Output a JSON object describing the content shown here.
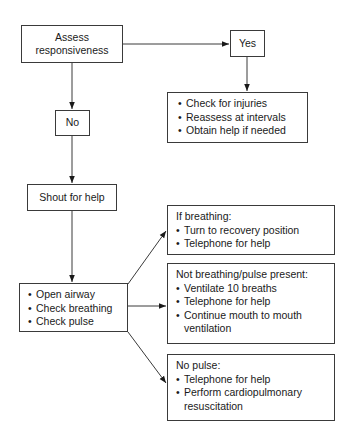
{
  "diagram": {
    "type": "flowchart",
    "nodes": {
      "assess": {
        "line1": "Assess",
        "line2": "responsiveness"
      },
      "yes": {
        "label": "Yes"
      },
      "no": {
        "label": "No"
      },
      "yes_actions": {
        "items": [
          "Check for injuries",
          "Reassess at intervals",
          "Obtain help if needed"
        ]
      },
      "shout": {
        "label": "Shout for help"
      },
      "abc": {
        "items": [
          "Open airway",
          "Check breathing",
          "Check pulse"
        ]
      },
      "breathing": {
        "heading": "If breathing:",
        "items": [
          "Turn to recovery position",
          "Telephone for help"
        ]
      },
      "not_breathing": {
        "heading": "Not breathing/pulse present:",
        "items": [
          "Ventilate 10 breaths",
          "Telephone for help",
          "Continue mouth to mouth ventilation"
        ]
      },
      "no_pulse": {
        "heading": "No pulse:",
        "items": [
          "Telephone for help",
          "Perform cardiopulmonary resuscitation"
        ]
      }
    },
    "edges": [
      {
        "from": "assess",
        "to": "yes"
      },
      {
        "from": "assess",
        "to": "no"
      },
      {
        "from": "yes",
        "to": "yes_actions"
      },
      {
        "from": "no",
        "to": "shout"
      },
      {
        "from": "shout",
        "to": "abc"
      },
      {
        "from": "abc",
        "to": "breathing"
      },
      {
        "from": "abc",
        "to": "not_breathing"
      },
      {
        "from": "abc",
        "to": "no_pulse"
      }
    ],
    "colors": {
      "line": "#3a3a3a",
      "text": "#1a1a1a",
      "background": "#ffffff"
    }
  }
}
